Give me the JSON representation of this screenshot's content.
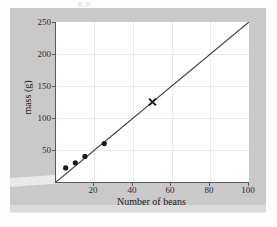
{
  "figure": {
    "top_cut_text": "g  p",
    "panel_color": "#c9c9c9",
    "plot_background": "#ffffff",
    "axis_color": "#5a5a5a",
    "grid_color": "#ebebeb",
    "line_color": "#4a4a4a",
    "marker_color": "#1a1a1a"
  },
  "chart_data": {
    "type": "scatter",
    "title": "",
    "xlabel": "Number of beans",
    "ylabel": "mass (g)",
    "xlim": [
      0,
      100
    ],
    "ylim": [
      0,
      250
    ],
    "xticks": [
      20,
      40,
      60,
      80,
      100
    ],
    "yticks": [
      50,
      100,
      150,
      200,
      250
    ],
    "grid": true,
    "legend": "none",
    "series": [
      {
        "name": "measured beans",
        "marker": "filled-circle",
        "points": [
          {
            "x": 5,
            "y": 22
          },
          {
            "x": 10,
            "y": 30
          },
          {
            "x": 15,
            "y": 40
          },
          {
            "x": 25,
            "y": 60
          }
        ]
      },
      {
        "name": "predicted value",
        "marker": "cross",
        "points": [
          {
            "x": 50,
            "y": 125
          }
        ]
      }
    ],
    "trendline": {
      "name": "line of best fit",
      "from": {
        "x": 0,
        "y": 0
      },
      "to": {
        "x": 100,
        "y": 250
      },
      "slope": 2.5,
      "intercept": 0
    }
  }
}
